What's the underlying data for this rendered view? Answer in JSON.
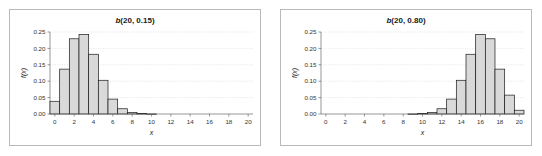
{
  "figure": {
    "panels": [
      {
        "id": "left-panel",
        "title_prefix": "b",
        "title_rest": "(20, 0.15)",
        "title_full": "b(20, 0.15)"
      },
      {
        "id": "right-panel",
        "title_prefix": "b",
        "title_rest": "(20, 0.80)",
        "title_full": "b(20, 0.80)"
      }
    ]
  },
  "chart_data": [
    {
      "type": "bar",
      "title": "b(20, 0.15)",
      "xlabel": "x",
      "ylabel": "f(x)",
      "xlim": [
        -0.5,
        20.5
      ],
      "ylim": [
        0.0,
        0.25
      ],
      "grid": true,
      "legend": null,
      "xticks": [
        0,
        2,
        4,
        6,
        8,
        10,
        12,
        14,
        16,
        18,
        20
      ],
      "xticklabels": [
        "0",
        "2",
        "4",
        "6",
        "8",
        "10",
        "12",
        "14",
        "16",
        "18",
        "20"
      ],
      "yticks": [
        0.0,
        0.05,
        0.1,
        0.15,
        0.2,
        0.25
      ],
      "yticklabels": [
        "0.00",
        "0.05",
        "0.10",
        "0.15",
        "0.20",
        "0.25"
      ],
      "categories": [
        0,
        1,
        2,
        3,
        4,
        5,
        6,
        7,
        8,
        9,
        10,
        11,
        12,
        13,
        14,
        15,
        16,
        17,
        18,
        19,
        20
      ],
      "values": [
        0.0388,
        0.1368,
        0.2293,
        0.2428,
        0.1821,
        0.1028,
        0.0454,
        0.016,
        0.0046,
        0.0011,
        0.0002,
        0.0,
        0.0,
        0.0,
        0.0,
        0.0,
        0.0,
        0.0,
        0.0,
        0.0,
        0.0
      ]
    },
    {
      "type": "bar",
      "title": "b(20, 0.80)",
      "xlabel": "x",
      "ylabel": "f(x)",
      "xlim": [
        -0.5,
        20.5
      ],
      "ylim": [
        0.0,
        0.25
      ],
      "grid": true,
      "legend": null,
      "xticks": [
        0,
        2,
        4,
        6,
        8,
        10,
        12,
        14,
        16,
        18,
        20
      ],
      "xticklabels": [
        "0",
        "2",
        "4",
        "6",
        "8",
        "10",
        "12",
        "14",
        "16",
        "18",
        "20"
      ],
      "yticks": [
        0.0,
        0.05,
        0.1,
        0.15,
        0.2,
        0.25
      ],
      "yticklabels": [
        "0.00",
        "0.05",
        "0.10",
        "0.15",
        "0.20",
        "0.25"
      ],
      "categories": [
        0,
        1,
        2,
        3,
        4,
        5,
        6,
        7,
        8,
        9,
        10,
        11,
        12,
        13,
        14,
        15,
        16,
        17,
        18,
        19,
        20
      ],
      "values": [
        0.0,
        0.0,
        0.0,
        0.0,
        0.0,
        0.0,
        0.0,
        0.0,
        0.0,
        0.0002,
        0.0011,
        0.0046,
        0.016,
        0.0454,
        0.1028,
        0.1821,
        0.2428,
        0.2293,
        0.1368,
        0.0576,
        0.0115
      ]
    }
  ],
  "style": {
    "bar_fill": "#d9d9d9",
    "bar_stroke": "#1a1a1a",
    "grid_color": "#c8c8c8",
    "axis_color": "#6b6b6b",
    "text_color": "#1a1a1a",
    "frame_color": "#b9b9b9",
    "background": "#ffffff"
  }
}
